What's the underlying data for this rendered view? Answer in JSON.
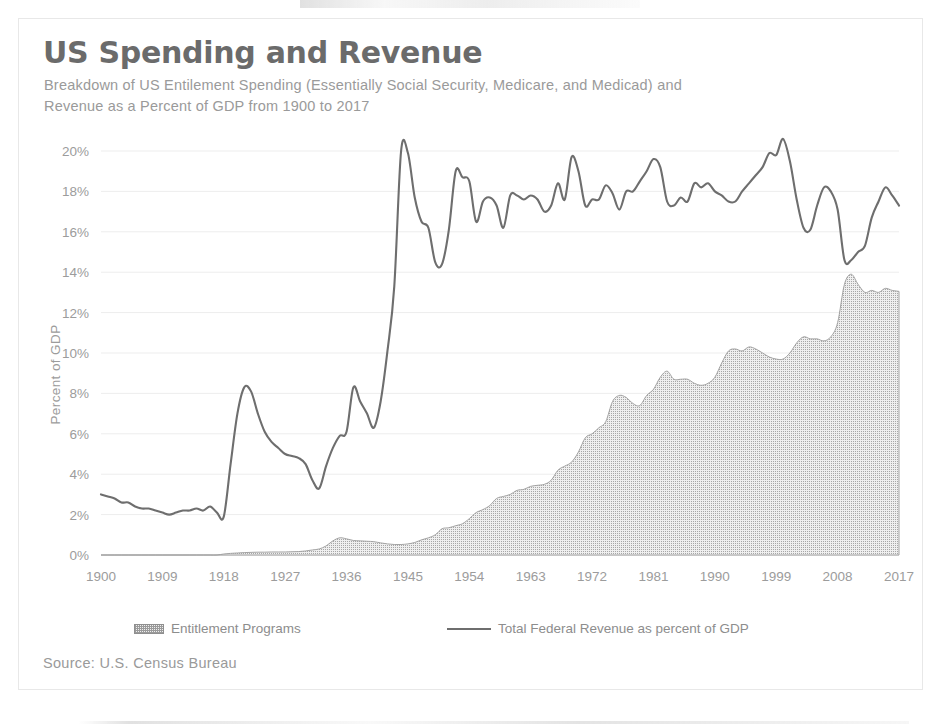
{
  "figure": {
    "title": "US Spending and Revenue",
    "subtitle": "Breakdown of US Entilement Spending (Essentially Social Security, Medicare, and Medicad) and Revenue as a Percent of GDP from 1900 to 2017",
    "source": "Source: U.S. Census Bureau",
    "colors": {
      "title": "#6b6b6b",
      "subtitle": "#9a9a9a",
      "axis_text": "#9c9c9c",
      "revenue_line": "#6e6e6e",
      "entitlement_fill": "#efefef",
      "entitlement_hatch": "#9a9a9a",
      "gridline": "#ededed",
      "frame": "#e8e8e8"
    }
  },
  "legend": {
    "position": "bottom",
    "entries": [
      {
        "label": "Entitlement Programs",
        "marker": "hatched-area-swatch"
      },
      {
        "label": "Total Federal Revenue as percent of GDP",
        "marker": "line-swatch"
      }
    ]
  },
  "chart_data": {
    "type": "area",
    "title": "US Spending and Revenue",
    "subtitle": "Breakdown of US Entilement Spending (Essentially Social Security, Medicare, and Medicad) and Revenue as a Percent of GDP from 1900 to 2017",
    "xlabel": "",
    "ylabel": "Percent of GDP",
    "xlim": [
      1900,
      2017
    ],
    "ylim": [
      0,
      20
    ],
    "ytick_values": [
      0,
      2,
      4,
      6,
      8,
      10,
      12,
      14,
      16,
      18,
      20
    ],
    "ytick_labels": [
      "0%",
      "2%",
      "4%",
      "6%",
      "8%",
      "10%",
      "12%",
      "14%",
      "16%",
      "18%",
      "20%"
    ],
    "xtick_values": [
      1900,
      1909,
      1918,
      1927,
      1936,
      1945,
      1954,
      1963,
      1972,
      1981,
      1990,
      1999,
      2008,
      2017
    ],
    "xtick_labels": [
      "1900",
      "1909",
      "1918",
      "1927",
      "1936",
      "1945",
      "1954",
      "1963",
      "1972",
      "1981",
      "1990",
      "1999",
      "2008",
      "2017"
    ],
    "grid": "horizontal-faint",
    "x": [
      1900,
      1901,
      1902,
      1903,
      1904,
      1905,
      1906,
      1907,
      1908,
      1909,
      1910,
      1911,
      1912,
      1913,
      1914,
      1915,
      1916,
      1917,
      1918,
      1919,
      1920,
      1921,
      1922,
      1923,
      1924,
      1925,
      1926,
      1927,
      1928,
      1929,
      1930,
      1931,
      1932,
      1933,
      1934,
      1935,
      1936,
      1937,
      1938,
      1939,
      1940,
      1941,
      1942,
      1943,
      1944,
      1945,
      1946,
      1947,
      1948,
      1949,
      1950,
      1951,
      1952,
      1953,
      1954,
      1955,
      1956,
      1957,
      1958,
      1959,
      1960,
      1961,
      1962,
      1963,
      1964,
      1965,
      1966,
      1967,
      1968,
      1969,
      1970,
      1971,
      1972,
      1973,
      1974,
      1975,
      1976,
      1977,
      1978,
      1979,
      1980,
      1981,
      1982,
      1983,
      1984,
      1985,
      1986,
      1987,
      1988,
      1989,
      1990,
      1991,
      1992,
      1993,
      1994,
      1995,
      1996,
      1997,
      1998,
      1999,
      2000,
      2001,
      2002,
      2003,
      2004,
      2005,
      2006,
      2007,
      2008,
      2009,
      2010,
      2011,
      2012,
      2013,
      2014,
      2015,
      2016,
      2017
    ],
    "series": [
      {
        "name": "Total Federal Revenue as percent of GDP",
        "render": "line",
        "values": [
          3.0,
          2.9,
          2.8,
          2.6,
          2.6,
          2.4,
          2.3,
          2.3,
          2.2,
          2.1,
          2.0,
          2.1,
          2.2,
          2.2,
          2.3,
          2.2,
          2.4,
          2.1,
          1.9,
          4.5,
          7.0,
          8.3,
          8.1,
          7.0,
          6.1,
          5.6,
          5.3,
          5.0,
          4.9,
          4.8,
          4.5,
          3.7,
          3.3,
          4.4,
          5.3,
          5.9,
          6.1,
          8.3,
          7.6,
          7.0,
          6.3,
          7.6,
          10.1,
          13.3,
          20.0,
          19.9,
          17.7,
          16.5,
          16.2,
          14.5,
          14.4,
          16.1,
          19.0,
          18.7,
          18.5,
          16.5,
          17.5,
          17.7,
          17.3,
          16.2,
          17.8,
          17.8,
          17.6,
          17.8,
          17.6,
          17.0,
          17.3,
          18.4,
          17.6,
          19.7,
          19.0,
          17.3,
          17.6,
          17.6,
          18.3,
          17.9,
          17.1,
          18.0,
          18.0,
          18.5,
          19.0,
          19.6,
          19.2,
          17.5,
          17.3,
          17.7,
          17.5,
          18.4,
          18.2,
          18.4,
          18.0,
          17.8,
          17.5,
          17.5,
          18.0,
          18.4,
          18.8,
          19.2,
          19.9,
          19.8,
          20.6,
          19.5,
          17.6,
          16.2,
          16.1,
          17.3,
          18.2,
          18.0,
          17.1,
          14.6,
          14.6,
          15.0,
          15.3,
          16.7,
          17.5,
          18.2,
          17.8,
          17.3
        ],
        "peak_points": [
          {
            "year": 1921,
            "value": 8.3,
            "note": "WWI peak"
          },
          {
            "year": 1944,
            "value": 20.0,
            "note": "WWII peak"
          },
          {
            "year": 2000,
            "value": 20.6,
            "note": "Dot-com era peak"
          },
          {
            "year": 2009,
            "value": 14.6,
            "note": "Great Recession trough"
          }
        ]
      },
      {
        "name": "Entitlement Programs",
        "render": "filled-area-hatched",
        "values": [
          0.0,
          0.0,
          0.0,
          0.0,
          0.0,
          0.0,
          0.0,
          0.0,
          0.0,
          0.0,
          0.0,
          0.0,
          0.0,
          0.0,
          0.0,
          0.0,
          0.0,
          0.0,
          0.05,
          0.08,
          0.1,
          0.12,
          0.13,
          0.14,
          0.14,
          0.15,
          0.15,
          0.15,
          0.16,
          0.17,
          0.2,
          0.25,
          0.3,
          0.45,
          0.7,
          0.85,
          0.8,
          0.72,
          0.7,
          0.68,
          0.66,
          0.6,
          0.55,
          0.52,
          0.52,
          0.55,
          0.62,
          0.75,
          0.85,
          1.0,
          1.3,
          1.35,
          1.45,
          1.55,
          1.8,
          2.1,
          2.25,
          2.45,
          2.8,
          2.9,
          3.0,
          3.2,
          3.25,
          3.4,
          3.45,
          3.5,
          3.7,
          4.2,
          4.4,
          4.6,
          5.1,
          5.8,
          6.0,
          6.3,
          6.6,
          7.6,
          7.9,
          7.8,
          7.5,
          7.4,
          7.9,
          8.2,
          8.8,
          9.1,
          8.7,
          8.7,
          8.7,
          8.5,
          8.4,
          8.5,
          8.8,
          9.5,
          10.1,
          10.2,
          10.1,
          10.3,
          10.2,
          10.0,
          9.8,
          9.7,
          9.7,
          10.0,
          10.5,
          10.8,
          10.7,
          10.7,
          10.6,
          10.8,
          11.5,
          13.4,
          13.9,
          13.4,
          13.0,
          13.1,
          13.0,
          13.2,
          13.1,
          13.05
        ],
        "peak_points": [
          {
            "year": 1935,
            "value": 0.85,
            "note": "New Deal start"
          },
          {
            "year": 2009,
            "value": 13.9,
            "note": "Great Recession peak"
          },
          {
            "year": 2017,
            "value": 13.05,
            "note": "Final value"
          }
        ]
      }
    ]
  }
}
